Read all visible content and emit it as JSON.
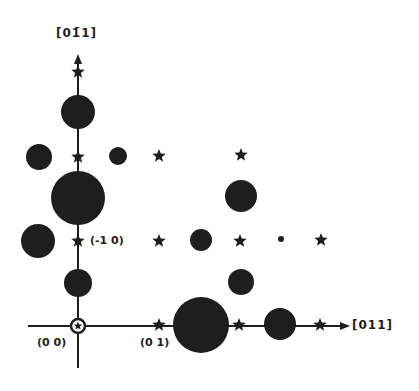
{
  "diagram": {
    "ink_color": "#1e1e1e",
    "background": "#ffffff",
    "axes": {
      "vertical": {
        "label": "[01̄1]",
        "direction": "up"
      },
      "horizontal": {
        "label": "[011]",
        "direction": "right"
      }
    },
    "point_labels": [
      {
        "id": "origin",
        "text": "(0 0)"
      },
      {
        "id": "h01",
        "text": "(0 1)"
      },
      {
        "id": "hm10",
        "text": "(-1 0)"
      }
    ],
    "legend": {
      "circle": "observed reflection (size ~ intensity)",
      "star": "lattice position"
    },
    "circles": [
      {
        "x": 78,
        "y": 112,
        "r": 17
      },
      {
        "x": 39,
        "y": 157,
        "r": 13
      },
      {
        "x": 118,
        "y": 156,
        "r": 9
      },
      {
        "x": 78,
        "y": 198,
        "r": 27
      },
      {
        "x": 241,
        "y": 196,
        "r": 16
      },
      {
        "x": 38,
        "y": 241,
        "r": 17
      },
      {
        "x": 201,
        "y": 240,
        "r": 11
      },
      {
        "x": 281,
        "y": 239,
        "r": 3
      },
      {
        "x": 78,
        "y": 283,
        "r": 14
      },
      {
        "x": 241,
        "y": 282,
        "r": 13
      },
      {
        "x": 201,
        "y": 325,
        "r": 28
      },
      {
        "x": 280,
        "y": 324,
        "r": 16
      }
    ],
    "stars": [
      {
        "x": 78,
        "y": 72
      },
      {
        "x": 78,
        "y": 157
      },
      {
        "x": 159,
        "y": 156
      },
      {
        "x": 241,
        "y": 155
      },
      {
        "x": 78,
        "y": 241
      },
      {
        "x": 159,
        "y": 241
      },
      {
        "x": 240,
        "y": 241
      },
      {
        "x": 321,
        "y": 240
      },
      {
        "x": 159,
        "y": 325
      },
      {
        "x": 239,
        "y": 325
      },
      {
        "x": 320,
        "y": 325
      }
    ]
  }
}
